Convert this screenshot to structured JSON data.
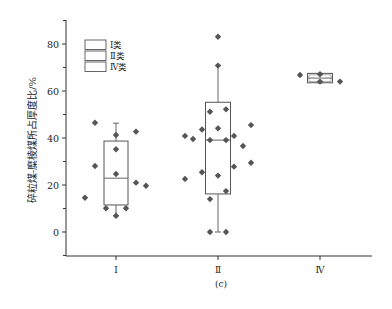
{
  "chart_data": {
    "type": "box",
    "subtitle": "(c)",
    "xlabel": "",
    "ylabel": "碎粒煤-糜棱煤所占厚度比/%",
    "ylim": [
      -10,
      90
    ],
    "yticks": [
      0,
      20,
      40,
      60,
      80
    ],
    "grid": false,
    "legend_position": "upper-left",
    "legend": [
      "Ⅰ类",
      "Ⅱ类",
      "Ⅳ类"
    ],
    "categories": [
      "Ⅰ",
      "Ⅱ",
      "Ⅳ"
    ],
    "series": [
      {
        "name": "Ⅰ类",
        "box": {
          "whisker_low": 6.9,
          "q1": 11.5,
          "median": 22.9,
          "q3": 38.7,
          "whisker_high": 46.3
        },
        "points": [
          {
            "dx": -21,
            "y": 46.5
          },
          {
            "dx": 0,
            "y": 41.3
          },
          {
            "dx": 20,
            "y": 42.7
          },
          {
            "dx": 0,
            "y": 35.2
          },
          {
            "dx": -21,
            "y": 28.1
          },
          {
            "dx": 0,
            "y": 24.7
          },
          {
            "dx": 20,
            "y": 21.0
          },
          {
            "dx": 30,
            "y": 19.7
          },
          {
            "dx": -31,
            "y": 14.6
          },
          {
            "dx": -10,
            "y": 10.1
          },
          {
            "dx": 10,
            "y": 10.1
          },
          {
            "dx": 0,
            "y": 6.9
          }
        ]
      },
      {
        "name": "Ⅱ类",
        "box": {
          "whisker_low": 0,
          "q1": 16.2,
          "median": 39.1,
          "q3": 55.2,
          "whisker_high": 70.8
        },
        "points": [
          {
            "dx": 0,
            "y": 83.1
          },
          {
            "dx": 0,
            "y": 70.8
          },
          {
            "dx": 8,
            "y": 52.2
          },
          {
            "dx": -8,
            "y": 51.2
          },
          {
            "dx": 33,
            "y": 45.5
          },
          {
            "dx": 0,
            "y": 44.1
          },
          {
            "dx": -16,
            "y": 43.6
          },
          {
            "dx": -33,
            "y": 40.9
          },
          {
            "dx": 16,
            "y": 40.9
          },
          {
            "dx": -25,
            "y": 39.6
          },
          {
            "dx": -8,
            "y": 39.1
          },
          {
            "dx": 8,
            "y": 39.1
          },
          {
            "dx": 25,
            "y": 36.6
          },
          {
            "dx": 33,
            "y": 29.5
          },
          {
            "dx": 16,
            "y": 27.8
          },
          {
            "dx": -16,
            "y": 25.4
          },
          {
            "dx": 0,
            "y": 24.0
          },
          {
            "dx": -33,
            "y": 22.6
          },
          {
            "dx": 8,
            "y": 17.4
          },
          {
            "dx": -8,
            "y": 14.0
          },
          {
            "dx": -8,
            "y": 0
          },
          {
            "dx": 8,
            "y": 0
          }
        ]
      },
      {
        "name": "Ⅳ类",
        "box": {
          "whisker_low": 63.5,
          "q1": 63.5,
          "median": 65.5,
          "q3": 67.5,
          "whisker_high": 67.5
        },
        "points": [
          {
            "dx": -20,
            "y": 66.8
          },
          {
            "dx": 0,
            "y": 67.1
          },
          {
            "dx": 0,
            "y": 64.0
          },
          {
            "dx": 20,
            "y": 64.0
          }
        ]
      }
    ]
  },
  "labels": {
    "ylabel": "碎粒煤-糜棱煤所占厚度比/%",
    "subtitle": "(c)",
    "legend": [
      {
        "roman": "Ⅰ",
        "suffix": "类"
      },
      {
        "roman": "Ⅱ",
        "suffix": "类"
      },
      {
        "roman": "Ⅳ",
        "suffix": "类"
      }
    ]
  }
}
